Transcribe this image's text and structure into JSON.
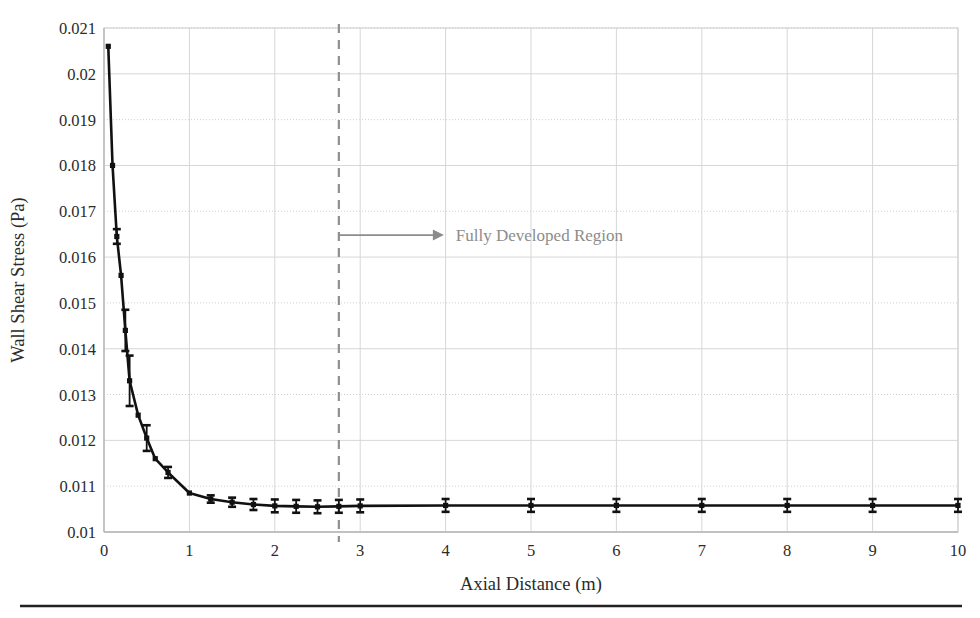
{
  "figure": {
    "background_color": "#ffffff",
    "bottom_rule": true
  },
  "chart_data": {
    "type": "line",
    "title": "",
    "xlabel": "Axial Distance (m)",
    "ylabel": "Wall Shear Stress (Pa)",
    "xlim": [
      0,
      10
    ],
    "ylim": [
      0.01,
      0.021
    ],
    "xticks": [
      "0",
      "1",
      "2",
      "3",
      "4",
      "5",
      "6",
      "7",
      "8",
      "9",
      "10"
    ],
    "xtick_values": [
      0,
      1,
      2,
      3,
      4,
      5,
      6,
      7,
      8,
      9,
      10
    ],
    "yticks": [
      "0.01",
      "0.011",
      "0.012",
      "0.013",
      "0.014",
      "0.015",
      "0.016",
      "0.017",
      "0.018",
      "0.019",
      "0.02",
      "0.021"
    ],
    "ytick_values": [
      0.01,
      0.011,
      0.012,
      0.013,
      0.014,
      0.015,
      0.016,
      0.017,
      0.018,
      0.019,
      0.02,
      0.021
    ],
    "grid": true,
    "legend": false,
    "series": [
      {
        "name": "Wall Shear Stress",
        "marker": "square",
        "color": "#111111",
        "x": [
          0.05,
          0.1,
          0.15,
          0.2,
          0.25,
          0.3,
          0.4,
          0.5,
          0.6,
          0.75,
          1.0,
          1.25,
          1.5,
          1.75,
          2.0,
          2.25,
          2.5,
          2.75,
          3.0,
          4.0,
          5.0,
          6.0,
          7.0,
          8.0,
          9.0,
          10.0
        ],
        "y": [
          0.0206,
          0.018,
          0.01645,
          0.0156,
          0.0144,
          0.0133,
          0.01255,
          0.01205,
          0.0116,
          0.0113,
          0.01085,
          0.01072,
          0.01065,
          0.0106,
          0.01057,
          0.01056,
          0.01055,
          0.01056,
          0.01057,
          0.01058,
          0.01058,
          0.01058,
          0.01058,
          0.01058,
          0.01058,
          0.01058
        ],
        "yerr": [
          0.0,
          0.0,
          0.00016,
          0.0,
          0.00045,
          0.00055,
          0.0,
          0.00028,
          0.0,
          0.00012,
          0.0,
          8e-05,
          0.0001,
          0.00012,
          0.00014,
          0.00014,
          0.00014,
          0.00014,
          0.00014,
          0.00014,
          0.00014,
          0.00014,
          0.00014,
          0.00014,
          0.00014,
          0.00014
        ]
      }
    ],
    "annotations": [
      {
        "name": "fully-developed-divider",
        "type": "vline",
        "x": 2.75,
        "style": "dashed",
        "color": "#8f8f8f"
      },
      {
        "name": "fully-developed-arrow",
        "type": "arrow",
        "x_start": 2.75,
        "x_end": 3.98,
        "y": 0.01648,
        "color": "#8c8c8c"
      },
      {
        "name": "fully-developed-label",
        "type": "text",
        "text": "Fully Developed Region",
        "x": 4.12,
        "y": 0.01648,
        "color": "#8c8c8c"
      }
    ]
  }
}
